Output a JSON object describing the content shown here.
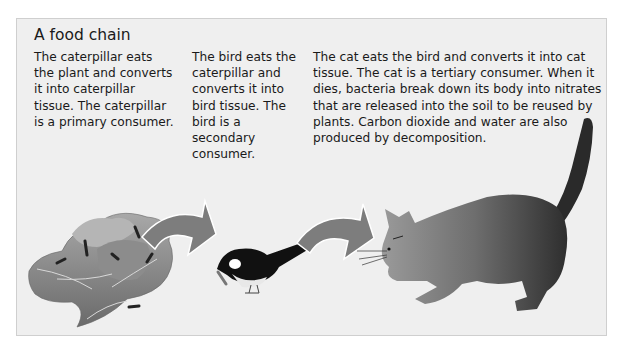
{
  "diagram": {
    "title": "A food chain",
    "stages": [
      {
        "organism": "plant (cabbage)",
        "role": "producer",
        "text": "The caterpillar eats the plant and converts it into caterpillar tissue. The caterpillar is a primary consumer."
      },
      {
        "organism": "bird",
        "role": "secondary consumer",
        "text": "The bird eats the caterpillar and converts it into bird tissue. The bird is a secondary consumer."
      },
      {
        "organism": "cat",
        "role": "tertiary consumer",
        "text": "The cat eats the bird and converts it into cat tissue. The cat is a tertiary consumer. When it dies, bacteria break down its body into nitrates that are released into the soil to be reused by plants. Carbon dioxide and water are also produced by decomposition."
      }
    ],
    "arrows": [
      {
        "from": "cabbage",
        "to": "bird"
      },
      {
        "from": "bird",
        "to": "cat"
      }
    ],
    "colors": {
      "panel_bg": "#efefef",
      "panel_border": "#cfcfcf",
      "arrow": "#7d7d7d",
      "text": "#1a1a1a"
    }
  }
}
